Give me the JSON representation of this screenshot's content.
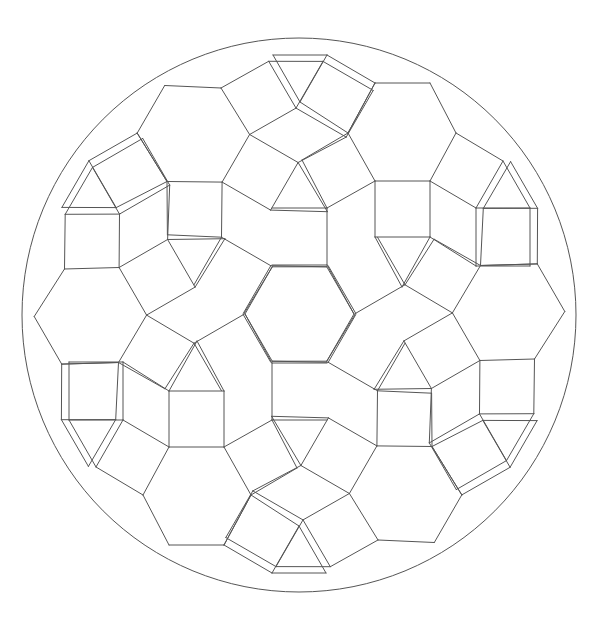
{
  "figure": {
    "stroke_color": "#555555",
    "background": "#ffffff",
    "circle": {
      "cx": 299,
      "cy": 315,
      "r": 277
    },
    "center": {
      "x": 299.5,
      "y": 314
    },
    "symmetry": 6,
    "sector_segments": [
      [
        75.5,
        -231,
        130.5,
        -231
      ],
      [
        130.5,
        -231,
        156.5,
        -181
      ],
      [
        156.5,
        -181,
        130.5,
        -133
      ],
      [
        130.5,
        -133,
        75.5,
        -133
      ],
      [
        75.5,
        -133,
        48.5,
        -181
      ],
      [
        48.5,
        -181,
        75.5,
        -231
      ],
      [
        75.5,
        -133,
        75.5,
        -77
      ],
      [
        130.5,
        -133,
        130.5,
        -77
      ],
      [
        75.5,
        -77,
        130.5,
        -77
      ],
      [
        75.5,
        -77,
        102.5,
        -27
      ],
      [
        130.5,
        -77,
        102.5,
        -27
      ],
      [
        156.5,
        -181,
        203.5,
        -153
      ],
      [
        203.5,
        -153,
        176.5,
        -106
      ],
      [
        176.5,
        -106,
        130.5,
        -133
      ],
      [
        176.5,
        -106,
        230.5,
        -106
      ],
      [
        230.5,
        -106,
        230.5,
        -48
      ],
      [
        230.5,
        -48,
        176.5,
        -48
      ],
      [
        176.5,
        -48,
        176.5,
        -106
      ],
      [
        203.5,
        -153,
        230.5,
        -106
      ],
      [
        130.5,
        -77,
        176.5,
        -48
      ],
      [
        48.5,
        -181,
        2.5,
        -154
      ],
      [
        2.5,
        -154,
        27.5,
        -106
      ],
      [
        27.5,
        -106,
        75.5,
        -133
      ],
      [
        48.5,
        -181,
        75.5,
        -231
      ],
      [
        75.5,
        -231,
        27.5,
        -259
      ],
      [
        27.5,
        -259,
        0.5,
        -212
      ],
      [
        0.5,
        -212,
        48.5,
        -181
      ],
      [
        27.5,
        -259,
        -26.5,
        -259
      ],
      [
        0.5,
        -212,
        -26.5,
        -259
      ],
      [
        27.5,
        -106,
        27.5,
        -49
      ],
      [
        -27.5,
        -49,
        27.5,
        -49
      ],
      [
        27.5,
        -106,
        -27.5,
        -106
      ],
      [
        27.5,
        -49,
        54.5,
        0
      ]
    ]
  }
}
